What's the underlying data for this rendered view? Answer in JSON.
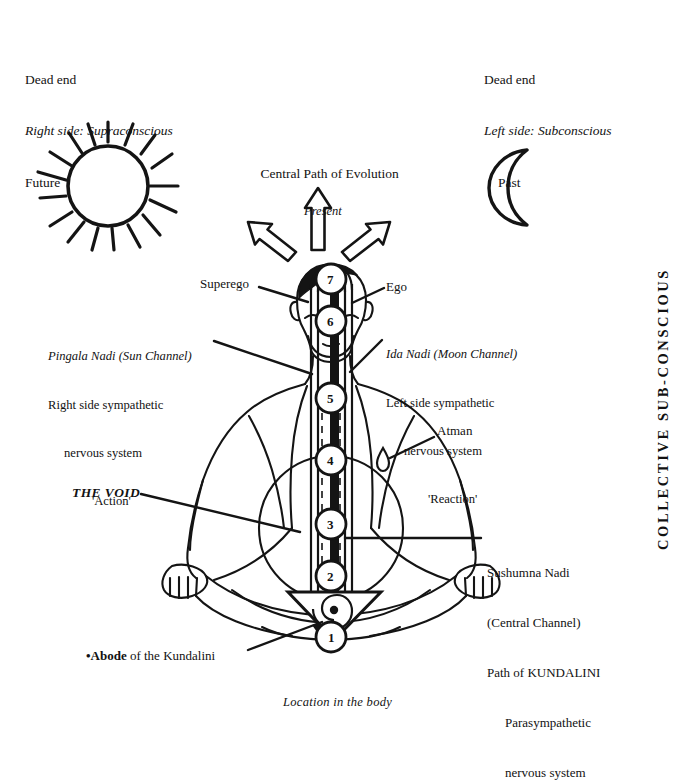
{
  "diagram": {
    "title_caption": "Location in the body",
    "ink_color": "#121212",
    "background": "#ffffff"
  },
  "corners": {
    "left": {
      "line1": "Dead end",
      "line2": "Right side: Supraconscious",
      "line3": "Future"
    },
    "right": {
      "line1": "Dead end",
      "line2": "Left side: Subconscious",
      "line3": "Past"
    }
  },
  "central": {
    "heading": "Central Path of Evolution",
    "subheading": "Present"
  },
  "labels": {
    "superego": "Superego",
    "ego": "Ego",
    "pingala": {
      "line1": "Pingala Nadi (Sun Channel)",
      "line2": "Right side sympathetic",
      "line3": "nervous system",
      "line4": "'Action'"
    },
    "ida": {
      "line1": "Ida Nadi (Moon Channel)",
      "line2": "Left side sympathetic",
      "line3": "nervous system",
      "line4": "'Reaction'"
    },
    "atman": "Atman",
    "void": "THE VOID",
    "sushumna": {
      "line1": "Sushumna Nadi",
      "line2": "(Central Channel)",
      "line3": "Path of KUNDALINI",
      "line4": "Parasympathetic",
      "line5": "nervous system"
    },
    "abode_marker": "•Abode",
    "abode_rest": " of the Kundalini",
    "collective": "COLLECTIVE  SUB-CONSCIOUS"
  },
  "chakras": [
    {
      "number": "1",
      "name": "mooladhara"
    },
    {
      "number": "2",
      "name": "swadisthana"
    },
    {
      "number": "3",
      "name": "nabhi"
    },
    {
      "number": "4",
      "name": "anahata"
    },
    {
      "number": "5",
      "name": "vishuddhi"
    },
    {
      "number": "6",
      "name": "agnya"
    },
    {
      "number": "7",
      "name": "sahasrara"
    }
  ],
  "icons": {
    "sun": "sun-icon",
    "moon": "moon-icon",
    "arrow_left": "arrow-up-left-icon",
    "arrow_up": "arrow-up-icon",
    "arrow_right": "arrow-up-right-icon",
    "flame": "atman-flame-icon",
    "triangle": "kundalini-triangle-icon",
    "coil": "kundalini-coil-icon"
  }
}
